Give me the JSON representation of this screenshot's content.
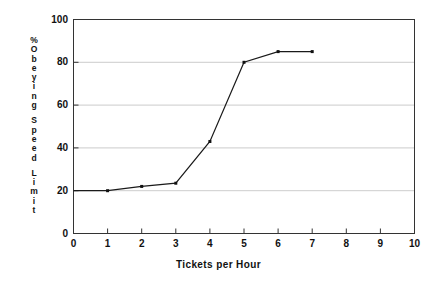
{
  "chart_data": {
    "type": "line",
    "title": "",
    "xlabel": "Tickets per Hour",
    "ylabel": "% Obeying Speed Limit",
    "ylabel_chars": [
      "%",
      "O",
      "b",
      "e",
      "y",
      "i",
      "n",
      "g",
      " ",
      "S",
      "p",
      "e",
      "e",
      "d",
      " ",
      "L",
      "i",
      "m",
      "i",
      "t"
    ],
    "x": [
      0,
      1,
      2,
      3,
      4,
      5,
      6,
      7
    ],
    "values": [
      20,
      20,
      22,
      23.5,
      43,
      80,
      85,
      85
    ],
    "marker_x": [
      1,
      2,
      3,
      4,
      5,
      6,
      7
    ],
    "marker_values": [
      20,
      22,
      23.5,
      43,
      80,
      85,
      85
    ],
    "xlim": [
      0,
      10
    ],
    "ylim": [
      0,
      100
    ],
    "xticks": [
      0,
      1,
      2,
      3,
      4,
      5,
      6,
      7,
      8,
      9,
      10
    ],
    "yticks": [
      0,
      20,
      40,
      60,
      80,
      100
    ],
    "xtick_labels": [
      "0",
      "1",
      "2",
      "3",
      "4",
      "5",
      "6",
      "7",
      "8",
      "9",
      "10"
    ],
    "ytick_labels": [
      "0",
      "20",
      "40",
      "60",
      "80",
      "100"
    ],
    "grid": "horizontal",
    "legend": null,
    "colors": {
      "line": "#1a1a1a",
      "marker": "#111111",
      "axis": "#333333",
      "grid": "#bfbfbf",
      "background": "#ffffff",
      "text": "#111111"
    }
  }
}
